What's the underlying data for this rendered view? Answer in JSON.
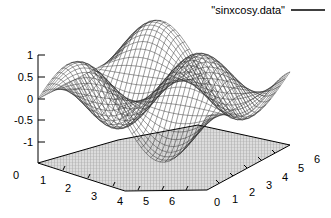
{
  "chart_data": {
    "type": "surface",
    "title": "",
    "subtitle": "",
    "xlabel": "",
    "ylabel": "",
    "zlabel": "",
    "function": "sin(x)*cos(y)",
    "legend": {
      "position": "top-right",
      "entries": [
        {
          "label": "\"sinxcosy.data\"",
          "style": "line",
          "color": "#000000"
        }
      ]
    },
    "grid": false,
    "projection": {
      "rot_x": 60,
      "rot_z": 30,
      "style": "wireframe-with-base-grid"
    },
    "axes": {
      "x": {
        "label": "",
        "min": 0,
        "max": 6.5,
        "ticks": [
          0,
          1,
          2,
          3,
          4,
          5,
          6
        ],
        "tick_labels": [
          "0",
          "1",
          "2",
          "3",
          "4",
          "5",
          "6"
        ]
      },
      "y": {
        "label": "",
        "min": 0,
        "max": 6.5,
        "ticks": [
          0,
          1,
          2,
          3,
          4,
          5,
          6
        ],
        "tick_labels": [
          "0",
          "1",
          "2",
          "3",
          "4",
          "5",
          "6"
        ]
      },
      "z": {
        "label": "",
        "min": -1.45,
        "max": 1.05,
        "ticks": [
          -1,
          -0.5,
          0,
          0.5,
          1
        ],
        "tick_labels": [
          "-1",
          "-0.5",
          "0",
          "0.5",
          "1"
        ],
        "base_label": "0"
      }
    },
    "surface": {
      "mesh_u": 36,
      "mesh_v": 36,
      "line_color": "#1a1a1a",
      "fill_color": "#ffffff",
      "hidden3d": true
    },
    "base_plane": {
      "z": -1.45,
      "fill": "#d8d8d8",
      "hatch": true,
      "hatch_color": "#8c8c8c",
      "border_color": "#000000"
    }
  }
}
